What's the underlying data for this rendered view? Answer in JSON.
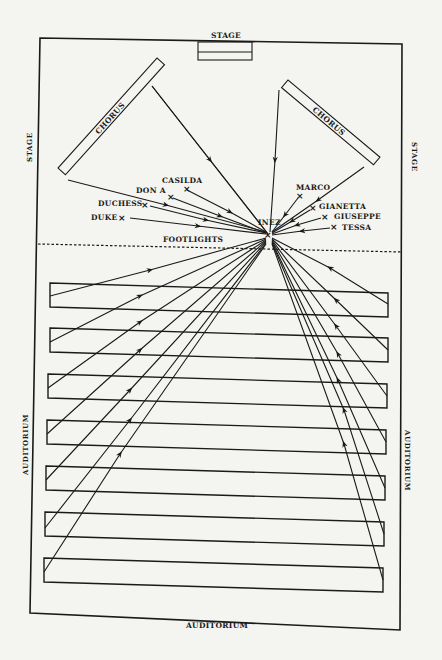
{
  "diagram": {
    "labels": {
      "stage_top": "STAGE",
      "stage_left": "STAGE",
      "stage_right": "STAGE",
      "auditorium_bottom": "AUDITORIUM",
      "auditorium_left": "AUDITORIUM",
      "auditorium_right": "AUDITORIUM",
      "footlights": "FOOTLIGHTS",
      "chorus_left": "CHORUS",
      "chorus_right": "CHORUS"
    },
    "center_character": {
      "name": "INEZ",
      "x": 268,
      "y": 234
    },
    "characters_left": [
      {
        "name": "CASILDA",
        "x": 187,
        "y": 188
      },
      {
        "name": "DON A",
        "x": 171,
        "y": 196
      },
      {
        "name": "DUCHESS",
        "x": 145,
        "y": 204
      },
      {
        "name": "DUKE",
        "x": 122,
        "y": 217
      }
    ],
    "characters_right": [
      {
        "name": "MARCO",
        "x": 300,
        "y": 195
      },
      {
        "name": "GIANETTA",
        "x": 313,
        "y": 207
      },
      {
        "name": "GIUSEPPE",
        "x": 325,
        "y": 216
      },
      {
        "name": "TESSA",
        "x": 334,
        "y": 226
      }
    ],
    "mark_symbol": "×",
    "audience_rows": 7,
    "colors": {
      "ink": "#1a1a1a",
      "paper": "#f4f4f1"
    }
  }
}
